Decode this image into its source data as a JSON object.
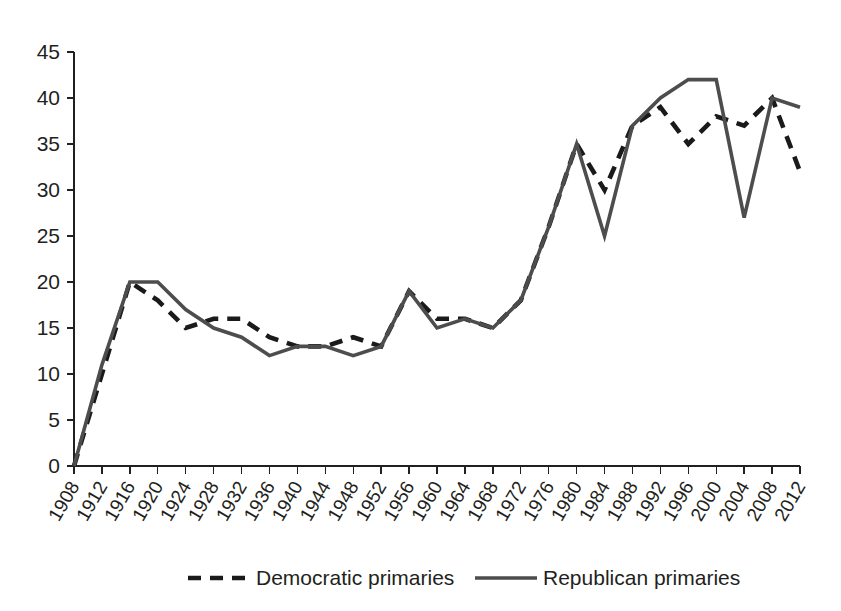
{
  "chart_data": {
    "type": "line",
    "title": "",
    "subtitle": "",
    "xlabel": "",
    "ylabel": "",
    "grid": false,
    "legend_position": "bottom",
    "xlim": [
      1908,
      2012
    ],
    "ylim": [
      0,
      45
    ],
    "ytick_step": 5,
    "yticks": [
      0,
      5,
      10,
      15,
      20,
      25,
      30,
      35,
      40,
      45
    ],
    "ytick_labels": [
      "0",
      "5",
      "10",
      "15",
      "20",
      "25",
      "30",
      "35",
      "40",
      "45"
    ],
    "categories": [
      "1908",
      "1912",
      "1916",
      "1920",
      "1924",
      "1928",
      "1932",
      "1936",
      "1940",
      "1944",
      "1948",
      "1952",
      "1956",
      "1960",
      "1964",
      "1968",
      "1972",
      "1976",
      "1980",
      "1984",
      "1988",
      "1992",
      "1996",
      "2000",
      "2004",
      "2008",
      "2012"
    ],
    "series": [
      {
        "name": "Democratic primaries",
        "style": "dashed",
        "color": "#1a1a1a",
        "values": [
          0,
          10,
          20,
          18,
          15,
          16,
          16,
          14,
          13,
          13,
          14,
          13,
          19,
          16,
          16,
          15,
          18,
          26,
          35,
          30,
          37,
          39,
          35,
          38,
          37,
          40,
          32
        ]
      },
      {
        "name": "Republican primaries",
        "style": "solid",
        "color": "#4d4d4d",
        "values": [
          0,
          11,
          20,
          20,
          17,
          15,
          14,
          12,
          13,
          13,
          12,
          13,
          19,
          15,
          16,
          15,
          18,
          26,
          35,
          25,
          37,
          40,
          42,
          42,
          27,
          40,
          39
        ]
      }
    ]
  },
  "legend": {
    "items": [
      {
        "label": "Democratic primaries",
        "style": "dashed"
      },
      {
        "label": "Republican primaries",
        "style": "solid"
      }
    ]
  }
}
